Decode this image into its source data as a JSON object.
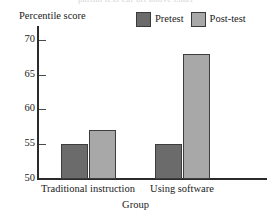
{
  "top_caption_sliver": "partial text cut off above chart",
  "chart_data": {
    "type": "bar",
    "title": "",
    "xlabel": "Group",
    "ylabel": "Percentile score",
    "categories": [
      "Traditional instruction",
      "Using software"
    ],
    "series": [
      {
        "name": "Pretest",
        "values": [
          55,
          55
        ],
        "color": "#6b6b6b"
      },
      {
        "name": "Post-test",
        "values": [
          57,
          68
        ],
        "color": "#a8a8a8"
      }
    ],
    "ylim": [
      50,
      72
    ],
    "yticks": [
      50,
      55,
      60,
      65,
      70
    ],
    "ytick_labels": [
      "50",
      "55",
      "60",
      "65",
      "70"
    ],
    "grid": false,
    "legend_position": "top-right",
    "axis_color": "#2b2b2b",
    "bar_border_color": "#3d3d3d",
    "background": "#ffffff"
  },
  "legend": {
    "items": [
      {
        "label": "Pretest",
        "color": "#6b6b6b"
      },
      {
        "label": "Post-test",
        "color": "#a8a8a8"
      }
    ]
  },
  "axes": {
    "y_title": "Percentile score",
    "x_title": "Group",
    "y_ticks": [
      "70",
      "65",
      "60",
      "55",
      "50"
    ],
    "x_categories": [
      "Traditional instruction",
      "Using software"
    ]
  }
}
